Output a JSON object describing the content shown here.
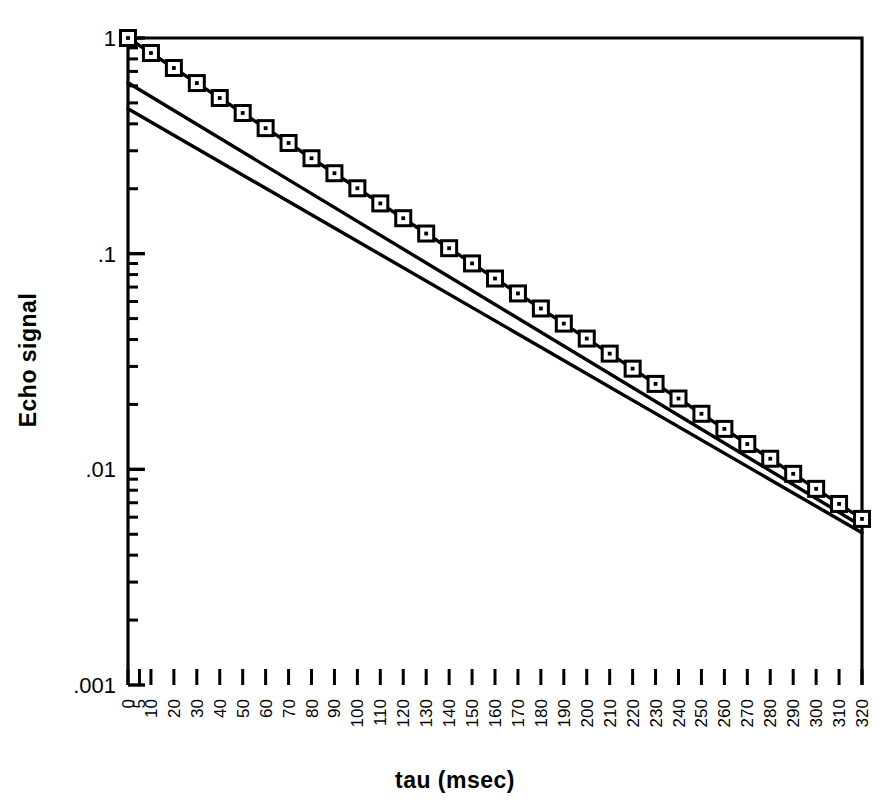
{
  "figure": {
    "background_color": "#ffffff",
    "ink_color": "#000000"
  },
  "axes": {
    "x_title": "tau (msec)",
    "y_title": "Echo signal",
    "y_tick_labels": [
      "1",
      ".1",
      ".01",
      ".001"
    ],
    "x_tick_labels": [
      "0",
      "5",
      "10",
      "20",
      "30",
      "40",
      "50",
      "60",
      "70",
      "80",
      "90",
      "100",
      "110",
      "120",
      "130",
      "140",
      "150",
      "160",
      "170",
      "180",
      "190",
      "200",
      "210",
      "220",
      "230",
      "240",
      "250",
      "260",
      "270",
      "280",
      "290",
      "300",
      "310",
      "320"
    ]
  },
  "chart_data": {
    "type": "line",
    "title": "",
    "xlabel": "tau (msec)",
    "ylabel": "Echo signal",
    "xlim": [
      0,
      320
    ],
    "ylim": [
      0.001,
      1
    ],
    "yscale": "log",
    "xscale": "linear",
    "grid": false,
    "legend": "none",
    "x_ticks": [
      0,
      5,
      10,
      20,
      30,
      40,
      50,
      60,
      70,
      80,
      90,
      100,
      110,
      120,
      130,
      140,
      150,
      160,
      170,
      180,
      190,
      200,
      210,
      220,
      230,
      240,
      250,
      260,
      270,
      280,
      290,
      300,
      310,
      320
    ],
    "y_ticks": [
      1,
      0.1,
      0.01,
      0.001
    ],
    "y_minor_ticks": true,
    "series": [
      {
        "name": "echo-decay-data",
        "marker": "open-square-with-center-dot",
        "style": "line-with-markers",
        "x": [
          0,
          10,
          20,
          30,
          40,
          50,
          60,
          70,
          80,
          90,
          100,
          110,
          120,
          130,
          140,
          150,
          160,
          170,
          180,
          190,
          200,
          210,
          220,
          230,
          240,
          250,
          260,
          270,
          280,
          290,
          300,
          310,
          320
        ],
        "values": [
          1.0,
          0.852,
          0.726,
          0.618,
          0.527,
          0.449,
          0.382,
          0.326,
          0.277,
          0.236,
          0.201,
          0.171,
          0.146,
          0.124,
          0.106,
          0.0901,
          0.0767,
          0.0654,
          0.0557,
          0.0474,
          0.0404,
          0.0344,
          0.0293,
          0.0249,
          0.0213,
          0.0181,
          0.0154,
          0.0131,
          0.0112,
          0.00953,
          0.00812,
          0.00691,
          0.00589
        ]
      },
      {
        "name": "reference-line-upper",
        "marker": "none",
        "style": "solid-line",
        "x": [
          0,
          320
        ],
        "values": [
          0.62,
          0.00545
        ]
      },
      {
        "name": "reference-line-lower",
        "marker": "none",
        "style": "solid-line",
        "x": [
          0,
          320
        ],
        "values": [
          0.47,
          0.00508
        ]
      }
    ]
  }
}
